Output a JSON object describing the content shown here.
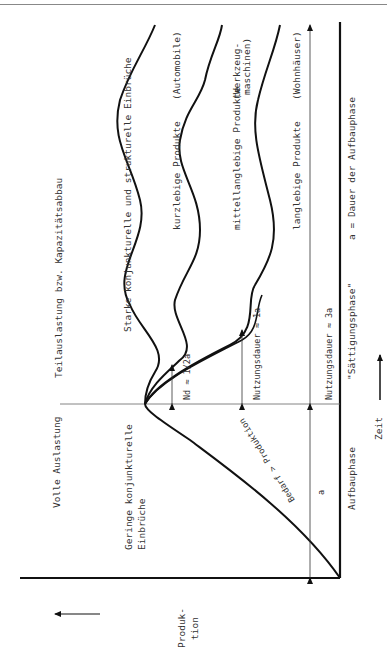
{
  "diagram": {
    "orientation": "rotated-90-ccw",
    "axes": {
      "y_label_line1": "Produk-",
      "y_label_line2": "tion",
      "x_label": "Zeit"
    },
    "phases": {
      "build_up": "Aufbauphase",
      "saturation": "\"Sättigungsphase\"",
      "legend_a": "a = Dauer der Aufbauphase"
    },
    "zones": {
      "full_load": "Volle Auslastung",
      "partial_load": "Teilauslastung bzw. Kapazitätsabbau"
    },
    "annotations": {
      "minor_dips_line1": "Geringe konjunkturelle",
      "minor_dips_line2": "Einbrüche",
      "strong_dips": "Starke konjunkturelle und strukturelle Einbrüche",
      "demand_gt_production": "Bedarf > Produktion",
      "a_marker": "a",
      "nd_short": "Nd ≈ 1/2a",
      "nd_medium": "Nutzungsdauer ≈ 1a",
      "nd_long": "Nutzungsdauer ≈ 3a"
    },
    "curves": [
      {
        "label": "kurzlebige Produkte",
        "example": "(Automobile)"
      },
      {
        "label": "mittellanglebige Produkte",
        "example_line1": "(Werkzeug-",
        "example_line2": "maschinen)"
      },
      {
        "label": "langlebige Produkte",
        "example": "(Wohnhäuser)"
      }
    ]
  }
}
